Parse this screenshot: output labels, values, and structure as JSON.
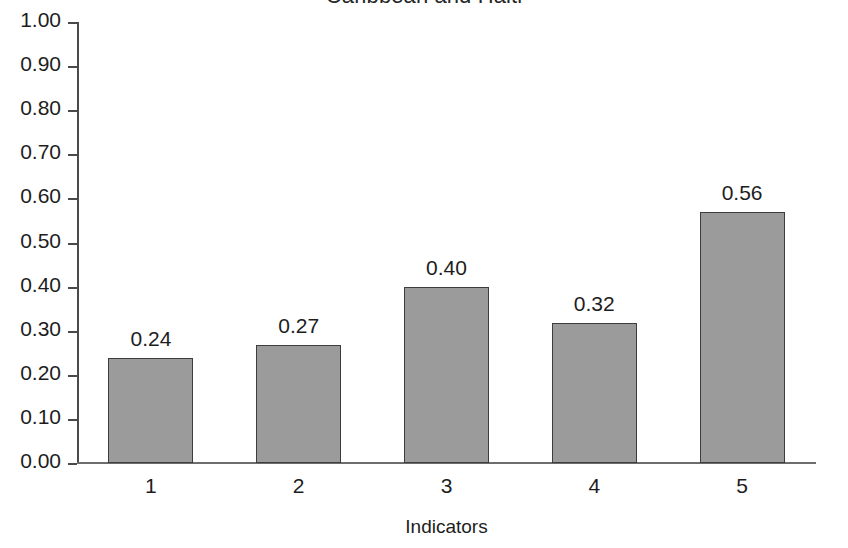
{
  "chart_data": {
    "type": "bar",
    "title": "Caribbean and Haiti",
    "xlabel": "Indicators",
    "ylabel": "",
    "categories": [
      "1",
      "2",
      "3",
      "4",
      "5"
    ],
    "values": [
      0.24,
      0.27,
      0.4,
      0.32,
      0.56
    ],
    "value_labels": [
      "0.24",
      "0.27",
      "0.40",
      "0.32",
      "0.56"
    ],
    "bar_fractions": [
      0.238,
      0.268,
      0.399,
      0.317,
      0.569
    ],
    "ylim": [
      0.0,
      1.0
    ],
    "ytick_values": [
      1.0,
      0.9,
      0.8,
      0.7,
      0.6,
      0.5,
      0.4,
      0.3,
      0.2,
      0.1,
      0.0
    ],
    "ytick_labels": [
      "1.00",
      "0.90",
      "0.80",
      "0.70",
      "0.60",
      "0.50",
      "0.40",
      "0.30",
      "0.20",
      "0.10",
      "0.00"
    ],
    "grid": false,
    "legend": null,
    "bar_color": "#9b9b9b",
    "bar_edge_color": "#3d3d3d",
    "axis_color": "#4a4a4a",
    "text_color": "#1d1d1d",
    "background_color": "#ffffff"
  }
}
